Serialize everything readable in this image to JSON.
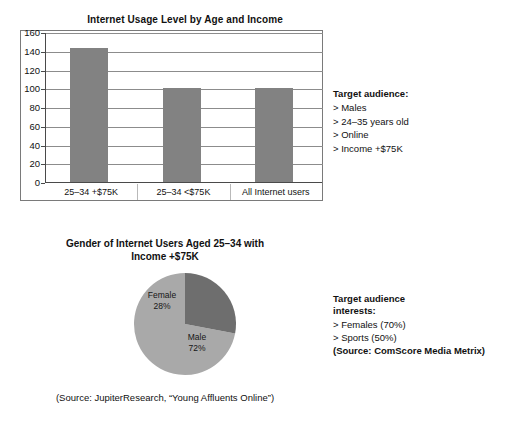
{
  "bar_panel": {
    "title": "Internet Usage Level by Age and Income"
  },
  "pie_panel": {
    "title_line1": "Gender of Internet Users Aged 25–34 with",
    "title_line2": "Income +$75K",
    "source": "(Source: JupiterResearch, “Young Affluents Online”)"
  },
  "target_audience": {
    "heading": "Target audience:",
    "items": [
      "> Males",
      "> 24–35 years old",
      "> Online",
      "> Income +$75K"
    ]
  },
  "target_interests": {
    "heading_line1": "Target audience",
    "heading_line2": "interests:",
    "items": [
      "> Females (70%)",
      "> Sports (50%)"
    ],
    "source": "(Source: ComScore Media Metrix)"
  },
  "colors": {
    "bar_fill": "#828282",
    "pie_male": "#a9a9a9",
    "pie_female": "#6e6e6e",
    "gridline": "#8c8c8c",
    "axis": "#4a4a4a",
    "frame": "#7a7a7a",
    "text": "#111111",
    "background": "#ffffff"
  },
  "chart_data": [
    {
      "type": "bar",
      "title": "Internet Usage Level by Age and Income",
      "categories": [
        "25–34 +$75K",
        "25–34 <$75K",
        "All Internet users"
      ],
      "values": [
        143,
        100,
        100
      ],
      "xlabel": "",
      "ylabel": "",
      "ylim": [
        0,
        160
      ],
      "yticks": [
        0,
        20,
        40,
        60,
        80,
        100,
        120,
        140,
        160
      ],
      "grid": true,
      "legend": "none",
      "orientation": "vertical"
    },
    {
      "type": "pie",
      "title": "Gender of Internet Users Aged 25–34 with Income +$75K",
      "labels": [
        "Male",
        "Female"
      ],
      "values": [
        72,
        28
      ],
      "value_labels": [
        "72%",
        "28%"
      ],
      "slice_colors": [
        "#a9a9a9",
        "#6e6e6e"
      ],
      "legend": "none",
      "start_angle_deg": 90,
      "direction": "counterclockwise",
      "source": "(Source: JupiterResearch, “Young Affluents Online”)"
    }
  ]
}
